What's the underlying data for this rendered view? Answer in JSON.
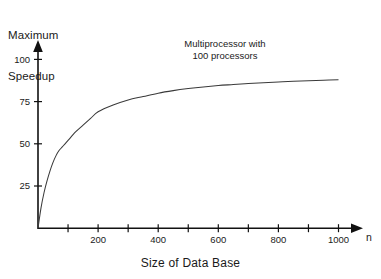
{
  "chart_data": {
    "type": "line",
    "title": "",
    "annotation": [
      "Multiprocessor with",
      "100 processors"
    ],
    "annotation_text": "Multiprocessor with 100 processors",
    "ylabel_lines": [
      "Maximum",
      "Speedup"
    ],
    "ylabel": "Maximum Speedup",
    "xlabel": "Size of Data Base",
    "x_axis_name": "n",
    "grid": false,
    "legend": "none",
    "xlim": [
      0,
      1100
    ],
    "ylim": [
      0,
      105
    ],
    "x_ticks": [
      100,
      200,
      300,
      400,
      500,
      600,
      700,
      800,
      900,
      1000
    ],
    "x_tick_labels": [
      "",
      "200",
      "",
      "400",
      "",
      "600",
      "",
      "800",
      "",
      "1000"
    ],
    "y_ticks": [
      25,
      50,
      75,
      100
    ],
    "y_tick_labels": [
      "25",
      "50",
      "75",
      "100"
    ],
    "series": [
      {
        "name": "Maximum Speedup",
        "x": [
          0,
          10,
          20,
          30,
          40,
          50,
          60,
          70,
          80,
          90,
          100,
          125,
          150,
          175,
          200,
          250,
          300,
          350,
          400,
          450,
          500,
          550,
          600,
          650,
          700,
          750,
          800,
          850,
          900,
          950,
          1000
        ],
        "values": [
          0,
          12,
          21,
          28,
          34,
          39,
          43,
          46,
          48,
          50,
          52,
          57,
          61,
          65,
          69,
          73,
          76,
          78,
          80,
          81.5,
          82.7,
          83.7,
          84.5,
          85.1,
          85.7,
          86.2,
          86.6,
          87.0,
          87.3,
          87.7,
          88.0
        ]
      }
    ],
    "colors": {
      "curve": "#3a3a3a",
      "axis": "#111111",
      "text": "#1a1a1a",
      "background": "#ffffff"
    }
  }
}
